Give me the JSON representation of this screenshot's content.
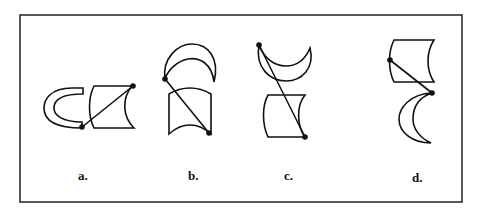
{
  "figure": {
    "options": [
      {
        "label": "a.",
        "description": "C-shaped arc band and concave-sided quadrilateral placed side by side, connected by a line between two dots"
      },
      {
        "label": "b.",
        "description": "Crescent above a concave-sided quadrilateral, connected by a diagonal line between two dots"
      },
      {
        "label": "c.",
        "description": "Upward-opening crescent above a concave-sided quadrilateral, connected by a long diagonal line between two dots"
      },
      {
        "label": "d.",
        "description": "Concave-sided quadrilateral above a left-facing crescent, connected by a short diagonal line between two dots"
      }
    ],
    "stroke_color": "#111111",
    "background_color": "#ffffff"
  }
}
